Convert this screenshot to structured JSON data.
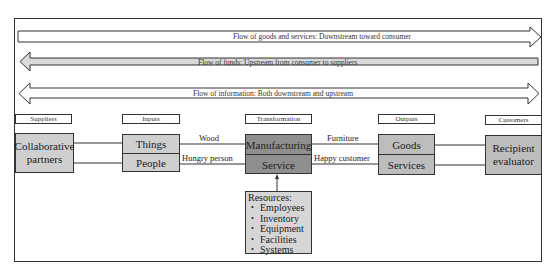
{
  "flows": [
    {
      "label": "Flow of goods and services: Downstream toward consumer",
      "direction": "right",
      "fill": "#ffffff"
    },
    {
      "label": "Flow of funds: Upstream from consumer to suppliers",
      "direction": "left",
      "fill": "#d9d9d9"
    },
    {
      "label": "Flow of information: Both downstream and upstream",
      "direction": "both",
      "fill": "#ffffff"
    }
  ],
  "columns": {
    "suppliers": "Suppliers",
    "inputs": "Inputs",
    "transformation": "Transformation",
    "outputs": "Outputs",
    "customers": "Customers"
  },
  "boxes": {
    "suppliers": {
      "line1": "Collaborative",
      "line2": "partners"
    },
    "inputs": {
      "top": "Things",
      "bottom": "People"
    },
    "transformation": {
      "top": "Manufacturing",
      "bottom": "Service"
    },
    "outputs": {
      "top": "Goods",
      "bottom": "Services"
    },
    "customers": {
      "line1": "Recipient",
      "line2": "evaluator"
    }
  },
  "links": {
    "wood": "Wood",
    "hungry_person": "Hungry person",
    "furniture": "Furniture",
    "happy_customer": "Happy customer"
  },
  "resources": {
    "title": "Resources:",
    "items": [
      "Employees",
      "Inventory",
      "Equipment",
      "Facilities",
      "Systems"
    ]
  },
  "colors": {
    "transformation_fill": "#8f8f8f",
    "io_fill": "#cfcfcf",
    "customer_fill": "#bdbdbd",
    "resources_fill": "#d6d6d6",
    "funds_arrow_fill": "#d9d9d9"
  }
}
